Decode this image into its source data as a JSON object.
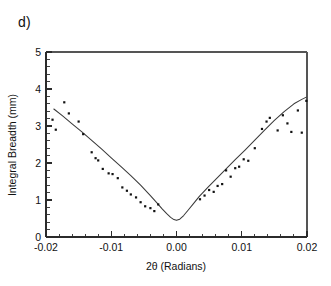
{
  "figure": {
    "panel_label": "d)",
    "background_color": "#ffffff",
    "foreground_color": "#111111"
  },
  "chart_data": {
    "type": "scatter",
    "title": "",
    "subtitle": "",
    "panel_label": "d)",
    "xlabel": "2θ (Radians)",
    "ylabel": "Integral Breadth (mm)",
    "xlim": [
      -0.02,
      0.02
    ],
    "ylim": [
      0,
      5
    ],
    "xticks": [
      -0.02,
      -0.01,
      0.0,
      0.01,
      0.02
    ],
    "xticklabels": [
      "-0.02",
      "-0.01",
      "0.00",
      "0.01",
      "0.02"
    ],
    "yticks": [
      0,
      1,
      2,
      3,
      4,
      5
    ],
    "yticklabels": [
      "0",
      "1",
      "2",
      "3",
      "4",
      "5"
    ],
    "x_minor_tick_count": 4,
    "y_minor_tick_count": 4,
    "grid": false,
    "legend": null,
    "frame": "top-and-left-axes-with-right-spine",
    "series": [
      {
        "name": "measured",
        "type": "scatter",
        "marker": "square-dot",
        "marker_color": "#111111",
        "marker_size_px": 2.2,
        "points": [
          [
            -0.019,
            3.17
          ],
          [
            -0.0185,
            2.9
          ],
          [
            -0.0172,
            3.64
          ],
          [
            -0.0165,
            3.34
          ],
          [
            -0.015,
            3.12
          ],
          [
            -0.0143,
            2.78
          ],
          [
            -0.013,
            2.29
          ],
          [
            -0.0124,
            2.13
          ],
          [
            -0.012,
            2.07
          ],
          [
            -0.0113,
            1.84
          ],
          [
            -0.0104,
            1.72
          ],
          [
            -0.0098,
            1.7
          ],
          [
            -0.009,
            1.59
          ],
          [
            -0.0083,
            1.34
          ],
          [
            -0.0076,
            1.25
          ],
          [
            -0.007,
            1.15
          ],
          [
            -0.0062,
            1.07
          ],
          [
            -0.0055,
            0.94
          ],
          [
            -0.0048,
            0.83
          ],
          [
            -0.004,
            0.78
          ],
          [
            -0.0034,
            0.7
          ],
          [
            -0.0028,
            0.88
          ],
          [
            0.0036,
            1.02
          ],
          [
            0.0043,
            1.12
          ],
          [
            0.005,
            1.27
          ],
          [
            0.0057,
            1.22
          ],
          [
            0.0063,
            1.38
          ],
          [
            0.007,
            1.43
          ],
          [
            0.0076,
            1.8
          ],
          [
            0.0083,
            1.63
          ],
          [
            0.009,
            1.86
          ],
          [
            0.0096,
            1.9
          ],
          [
            0.0103,
            2.1
          ],
          [
            0.011,
            2.06
          ],
          [
            0.012,
            2.4
          ],
          [
            0.0131,
            2.92
          ],
          [
            0.0138,
            3.12
          ],
          [
            0.0143,
            3.22
          ],
          [
            0.0155,
            2.88
          ],
          [
            0.0163,
            3.29
          ],
          [
            0.017,
            3.07
          ],
          [
            0.0176,
            2.84
          ],
          [
            0.0186,
            3.42
          ],
          [
            0.0192,
            2.82
          ],
          [
            0.0199,
            3.68
          ]
        ]
      },
      {
        "name": "fitted model",
        "type": "line",
        "line_color": "#3a3a3a",
        "points": [
          [
            -0.0188,
            3.46
          ],
          [
            -0.0175,
            3.28
          ],
          [
            -0.016,
            3.06
          ],
          [
            -0.0145,
            2.84
          ],
          [
            -0.013,
            2.61
          ],
          [
            -0.0115,
            2.38
          ],
          [
            -0.01,
            2.14
          ],
          [
            -0.0085,
            1.9
          ],
          [
            -0.007,
            1.66
          ],
          [
            -0.0055,
            1.4
          ],
          [
            -0.004,
            1.12
          ],
          [
            -0.003,
            0.92
          ],
          [
            -0.0022,
            0.76
          ],
          [
            -0.0015,
            0.63
          ],
          [
            -0.0009,
            0.53
          ],
          [
            -0.0004,
            0.47
          ],
          [
            0.0,
            0.45
          ],
          [
            0.0005,
            0.48
          ],
          [
            0.0011,
            0.58
          ],
          [
            0.0018,
            0.73
          ],
          [
            0.0026,
            0.9
          ],
          [
            0.0035,
            1.1
          ],
          [
            0.0048,
            1.34
          ],
          [
            0.0062,
            1.59
          ],
          [
            0.0076,
            1.84
          ],
          [
            0.009,
            2.09
          ],
          [
            0.0105,
            2.35
          ],
          [
            0.012,
            2.62
          ],
          [
            0.0135,
            2.89
          ],
          [
            0.015,
            3.15
          ],
          [
            0.0165,
            3.39
          ],
          [
            0.018,
            3.6
          ],
          [
            0.0192,
            3.72
          ],
          [
            0.0199,
            3.78
          ]
        ]
      }
    ]
  }
}
